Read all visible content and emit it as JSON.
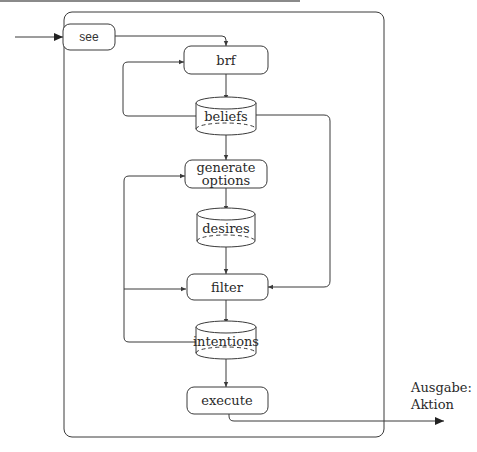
{
  "diagram": {
    "type": "flowchart",
    "title": "",
    "nodes": {
      "see": {
        "label": "see",
        "shape": "rounded-rect"
      },
      "brf": {
        "label": "brf",
        "shape": "rounded-rect"
      },
      "beliefs": {
        "label": "beliefs",
        "shape": "cylinder"
      },
      "generate_options": {
        "label_line1": "generate",
        "label_line2": "options",
        "shape": "rounded-rect"
      },
      "desires": {
        "label": "desires",
        "shape": "cylinder"
      },
      "filter": {
        "label": "filter",
        "shape": "rounded-rect"
      },
      "intentions": {
        "label": "intentions",
        "shape": "cylinder"
      },
      "execute": {
        "label": "execute",
        "shape": "rounded-rect"
      }
    },
    "output": {
      "label_line1": "Ausgabe:",
      "label_line2": "Aktion"
    },
    "edges": [
      {
        "from": "input",
        "to": "see"
      },
      {
        "from": "see",
        "to": "brf"
      },
      {
        "from": "brf",
        "to": "beliefs"
      },
      {
        "from": "beliefs",
        "to": "brf",
        "route": "left-loop"
      },
      {
        "from": "beliefs",
        "to": "generate_options"
      },
      {
        "from": "beliefs",
        "to": "filter",
        "route": "right"
      },
      {
        "from": "generate_options",
        "to": "desires"
      },
      {
        "from": "desires",
        "to": "filter"
      },
      {
        "from": "filter",
        "to": "intentions"
      },
      {
        "from": "intentions",
        "to": "generate_options",
        "route": "left-loop"
      },
      {
        "from": "intentions",
        "to": "filter",
        "route": "left-loop-branch"
      },
      {
        "from": "intentions",
        "to": "execute"
      },
      {
        "from": "execute",
        "to": "output"
      }
    ],
    "colors": {
      "stroke": "#3a3a3a",
      "background": "#ffffff",
      "text": "#2a2a2a"
    }
  }
}
